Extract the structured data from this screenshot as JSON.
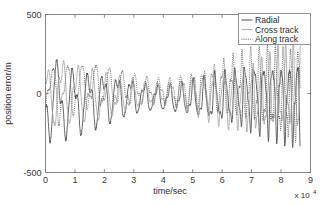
{
  "chart_data": {
    "type": "line",
    "title": "",
    "xlabel": "time/sec",
    "ylabel": "position error/m",
    "x_exponent_label": "x 10",
    "x_exponent_power": "4",
    "xlim": [
      0,
      90000
    ],
    "ylim": [
      -500,
      500
    ],
    "x_tick_values": [
      0,
      10000,
      20000,
      30000,
      40000,
      50000,
      60000,
      70000,
      80000,
      90000
    ],
    "x_tick_labels": [
      "0",
      "1",
      "2",
      "3",
      "4",
      "5",
      "6",
      "7",
      "8",
      "9"
    ],
    "y_tick_values": [
      -500,
      0,
      500
    ],
    "y_tick_labels": [
      "-500",
      "0",
      "500"
    ],
    "grid": false,
    "legend_position": "top-right",
    "x_data_max": 86500,
    "series": [
      {
        "name": "Radial",
        "style": "solid",
        "color": "#4a4a4a",
        "width": 0.85,
        "envelope": [
          {
            "t": 0,
            "amp": 330
          },
          {
            "t": 4000,
            "amp": 300
          },
          {
            "t": 10000,
            "amp": 250
          },
          {
            "t": 16000,
            "amp": 215
          },
          {
            "t": 22000,
            "amp": 185
          },
          {
            "t": 28000,
            "amp": 150
          },
          {
            "t": 34000,
            "amp": 110
          },
          {
            "t": 40000,
            "amp": 95
          },
          {
            "t": 46000,
            "amp": 115
          },
          {
            "t": 52000,
            "amp": 150
          },
          {
            "t": 58000,
            "amp": 185
          },
          {
            "t": 64000,
            "amp": 215
          },
          {
            "t": 70000,
            "amp": 250
          },
          {
            "t": 76000,
            "amp": 275
          },
          {
            "t": 82000,
            "amp": 300
          },
          {
            "t": 86500,
            "amp": 320
          }
        ],
        "period_start": 5600,
        "period_end": 2600,
        "phase": 3.3,
        "offset": -30
      },
      {
        "name": "Cross track",
        "style": "solid-light",
        "color": "#a8a8a8",
        "width": 0.85,
        "envelope": [
          {
            "t": 0,
            "amp": 190
          },
          {
            "t": 4000,
            "amp": 260
          },
          {
            "t": 10000,
            "amp": 215
          },
          {
            "t": 16000,
            "amp": 190
          },
          {
            "t": 22000,
            "amp": 160
          },
          {
            "t": 28000,
            "amp": 130
          },
          {
            "t": 34000,
            "amp": 100
          },
          {
            "t": 40000,
            "amp": 90
          },
          {
            "t": 46000,
            "amp": 110
          },
          {
            "t": 52000,
            "amp": 145
          },
          {
            "t": 58000,
            "amp": 180
          },
          {
            "t": 64000,
            "amp": 215
          },
          {
            "t": 70000,
            "amp": 250
          },
          {
            "t": 76000,
            "amp": 285
          },
          {
            "t": 82000,
            "amp": 320
          },
          {
            "t": 86500,
            "amp": 340
          }
        ],
        "period_start": 5400,
        "period_end": 2500,
        "phase": 1.1,
        "offset": -10
      },
      {
        "name": "Along track",
        "style": "dotted",
        "color": "#5a5a5a",
        "width": 0.85,
        "envelope": [
          {
            "t": 0,
            "amp": 150
          },
          {
            "t": 4000,
            "amp": 230
          },
          {
            "t": 10000,
            "amp": 190
          },
          {
            "t": 16000,
            "amp": 175
          },
          {
            "t": 22000,
            "amp": 150
          },
          {
            "t": 28000,
            "amp": 125
          },
          {
            "t": 34000,
            "amp": 100
          },
          {
            "t": 40000,
            "amp": 95
          },
          {
            "t": 46000,
            "amp": 120
          },
          {
            "t": 52000,
            "amp": 155
          },
          {
            "t": 58000,
            "amp": 195
          },
          {
            "t": 64000,
            "amp": 235
          },
          {
            "t": 70000,
            "amp": 275
          },
          {
            "t": 76000,
            "amp": 310
          },
          {
            "t": 82000,
            "amp": 345
          },
          {
            "t": 86500,
            "amp": 360
          }
        ],
        "period_start": 5200,
        "period_end": 2450,
        "phase": 5.0,
        "offset": 25
      }
    ],
    "legend_entries": [
      {
        "label": "Radial",
        "style": "solid",
        "color": "#4a4a4a"
      },
      {
        "label": "Cross track",
        "style": "solid-light",
        "color": "#a8a8a8"
      },
      {
        "label": "Along track",
        "style": "dotted",
        "color": "#5a5a5a"
      }
    ]
  },
  "layout": {
    "plot_left": 45.5,
    "plot_right": 310.5,
    "plot_top": 14.5,
    "plot_bottom": 172.5,
    "legend_x": 238.5,
    "legend_y": 13.5,
    "legend_w": 72,
    "legend_h": 31
  }
}
